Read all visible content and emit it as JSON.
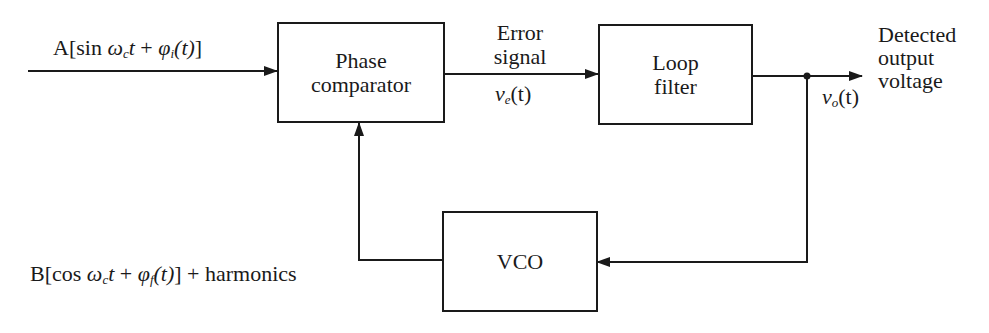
{
  "diagram": {
    "blocks": {
      "phase_comparator": {
        "line1": "Phase",
        "line2": "comparator"
      },
      "loop_filter": {
        "line1": "Loop",
        "line2": "filter"
      },
      "vco": {
        "label": "VCO"
      }
    },
    "signals": {
      "input": {
        "prefix": "A[sin ",
        "omega": "ω",
        "omega_sub": "c",
        "t": "t",
        "plus": " + ",
        "phi": "φ",
        "phi_sub": "i",
        "arg": "(t)",
        "suffix": "]"
      },
      "error": {
        "line1": "Error",
        "line2": "signal",
        "var": "v",
        "var_sub": "e",
        "arg": "(t)"
      },
      "output": {
        "var": "v",
        "var_sub": "o",
        "arg": "(t)",
        "line1": "Detected",
        "line2": "output",
        "line3": "voltage"
      },
      "feedback": {
        "prefix": "B[cos ",
        "omega": "ω",
        "omega_sub": "c",
        "t": "t",
        "plus": " + ",
        "phi": "φ",
        "phi_sub": "f",
        "arg": "(t)",
        "suffix": "] + harmonics"
      }
    },
    "colors": {
      "stroke": "#1a1a1a",
      "background": "#ffffff"
    }
  }
}
